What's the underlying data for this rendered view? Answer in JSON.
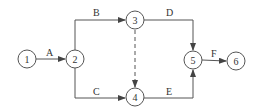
{
  "diagram": {
    "type": "activity-on-arrow network",
    "nodes": [
      {
        "id": "1",
        "label": "1"
      },
      {
        "id": "2",
        "label": "2"
      },
      {
        "id": "3",
        "label": "3"
      },
      {
        "id": "4",
        "label": "4"
      },
      {
        "id": "5",
        "label": "5"
      },
      {
        "id": "6",
        "label": "6"
      }
    ],
    "edges": [
      {
        "from": "1",
        "to": "2",
        "label": "A",
        "style": "solid"
      },
      {
        "from": "2",
        "to": "3",
        "label": "B",
        "style": "solid"
      },
      {
        "from": "2",
        "to": "4",
        "label": "C",
        "style": "solid"
      },
      {
        "from": "3",
        "to": "5",
        "label": "D",
        "style": "solid"
      },
      {
        "from": "3",
        "to": "4",
        "label": "",
        "style": "dashed"
      },
      {
        "from": "4",
        "to": "5",
        "label": "E",
        "style": "solid"
      },
      {
        "from": "5",
        "to": "6",
        "label": "F",
        "style": "solid"
      }
    ]
  }
}
